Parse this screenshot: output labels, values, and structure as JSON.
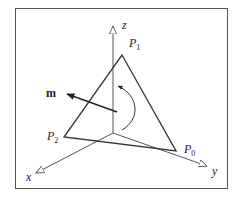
{
  "figure": {
    "type": "3d-coordinate-diagram",
    "axes": {
      "x": {
        "label": "x"
      },
      "y": {
        "label": "y"
      },
      "z": {
        "label": "z"
      }
    },
    "vertices": [
      {
        "id": "P0",
        "label": "P",
        "sub": "0"
      },
      {
        "id": "P1",
        "label": "P",
        "sub": "1"
      },
      {
        "id": "P2",
        "label": "P",
        "sub": "2"
      }
    ],
    "normal_vector": {
      "label": "m"
    },
    "rotation_arrow": {
      "direction": "counterclockwise"
    },
    "colors": {
      "line": "#333333",
      "axis": "#555555",
      "background": "#ffffff"
    }
  }
}
